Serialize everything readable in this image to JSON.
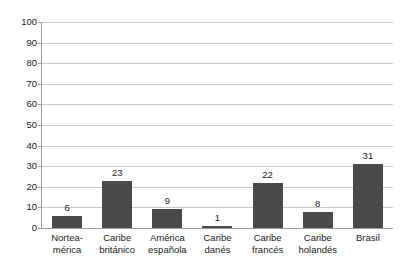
{
  "chart_data": {
    "type": "bar",
    "title": "",
    "subtitle": "",
    "xlabel": "",
    "ylabel": "",
    "categories": [
      "Norteamérica",
      "Caribe británico",
      "América española",
      "Caribe danés",
      "Caribe francés",
      "Caribe holandés",
      "Brasil"
    ],
    "category_lines": [
      [
        "Nortea-",
        "mérica"
      ],
      [
        "Caribe",
        "británico"
      ],
      [
        "América",
        "española"
      ],
      [
        "Caribe",
        "danés"
      ],
      [
        "Caribe",
        "francés"
      ],
      [
        "Caribe",
        "holandés"
      ],
      [
        "Brasil",
        ""
      ]
    ],
    "values": [
      6,
      23,
      9,
      1,
      22,
      8,
      31
    ],
    "value_labels": [
      "6",
      "23",
      "9",
      "1",
      "22",
      "8",
      "31"
    ],
    "ylim": [
      0,
      100
    ],
    "ytick_values": [
      0,
      10,
      20,
      30,
      40,
      50,
      60,
      70,
      80,
      90,
      100
    ],
    "ytick_labels": [
      "0",
      "10",
      "20",
      "30",
      "40",
      "50",
      "60",
      "70",
      "80",
      "90",
      "100"
    ],
    "grid": true,
    "legend": false,
    "legend_position": "none",
    "bar_color": "#4a4a4a",
    "gridline_color": "#c9c9c9",
    "axis_color": "#9a9a9a",
    "background_color": "#ffffff"
  }
}
